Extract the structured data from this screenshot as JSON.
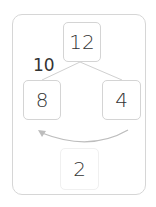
{
  "diagram": {
    "top": "12",
    "edge_label": "10",
    "left": "8",
    "right": "4",
    "bottom": "2",
    "colors": {
      "border": "#d4d4d4",
      "line": "#cfcfcf",
      "text": "#333333"
    }
  }
}
